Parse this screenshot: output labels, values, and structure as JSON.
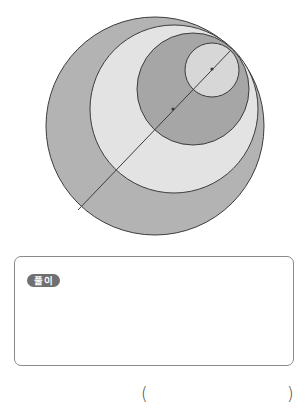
{
  "figure": {
    "colors": {
      "outer_fill": "#b3b3b3",
      "ring2_fill": "#e3e3e3",
      "ring3_fill": "#a6a6a6",
      "inner_fill": "#d7d7d7",
      "stroke": "#3c3c3c"
    },
    "circles": [
      {
        "cx": 155,
        "cy": 126,
        "r": 109
      },
      {
        "cx": 174,
        "cy": 109,
        "r": 84
      },
      {
        "cx": 193,
        "cy": 89,
        "r": 56
      },
      {
        "cx": 212,
        "cy": 70,
        "r": 27
      }
    ],
    "line": {
      "x1": 231,
      "y1": 50,
      "x2": 78,
      "y2": 210
    },
    "center_dots": [
      {
        "cx": 212,
        "cy": 69
      },
      {
        "cx": 173,
        "cy": 109
      }
    ]
  },
  "solution_box": {
    "badge_label": "풀이"
  },
  "answer": {
    "open_paren": "(",
    "close_paren": ")"
  }
}
